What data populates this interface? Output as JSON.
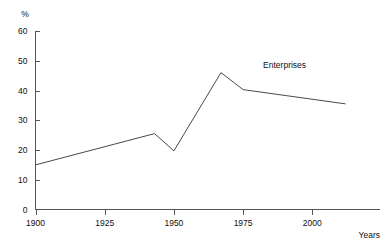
{
  "chart_data": {
    "type": "line",
    "title": "",
    "xlabel": "Years",
    "ylabel": "%",
    "xlim": [
      1900,
      2015
    ],
    "ylim": [
      0,
      60
    ],
    "grid": false,
    "legend_position": "inline-right",
    "x_ticks": [
      1900,
      1925,
      1950,
      1975,
      2000
    ],
    "x_tick_labels": [
      "1900",
      "1925",
      "1950",
      "1975",
      "2000"
    ],
    "y_ticks": [
      0,
      10,
      20,
      30,
      40,
      50,
      60
    ],
    "y_tick_labels": [
      "0",
      "10",
      "20",
      "30",
      "40",
      "50",
      "60"
    ],
    "series": [
      {
        "name": "Enterprises",
        "label": "Enterprises",
        "color": "#4a4a4a",
        "points": [
          {
            "x": 1900,
            "y": 15.0
          },
          {
            "x": 1943,
            "y": 25.5
          },
          {
            "x": 1950,
            "y": 19.7
          },
          {
            "x": 1967,
            "y": 46.0
          },
          {
            "x": 1975,
            "y": 40.3
          },
          {
            "x": 2012,
            "y": 35.5
          }
        ]
      }
    ],
    "annotations": [
      {
        "text": "Enterprises",
        "x": 1990,
        "y": 47.5
      }
    ]
  },
  "axes": {
    "y_unit_label": "%",
    "x_axis_title": "Years"
  }
}
